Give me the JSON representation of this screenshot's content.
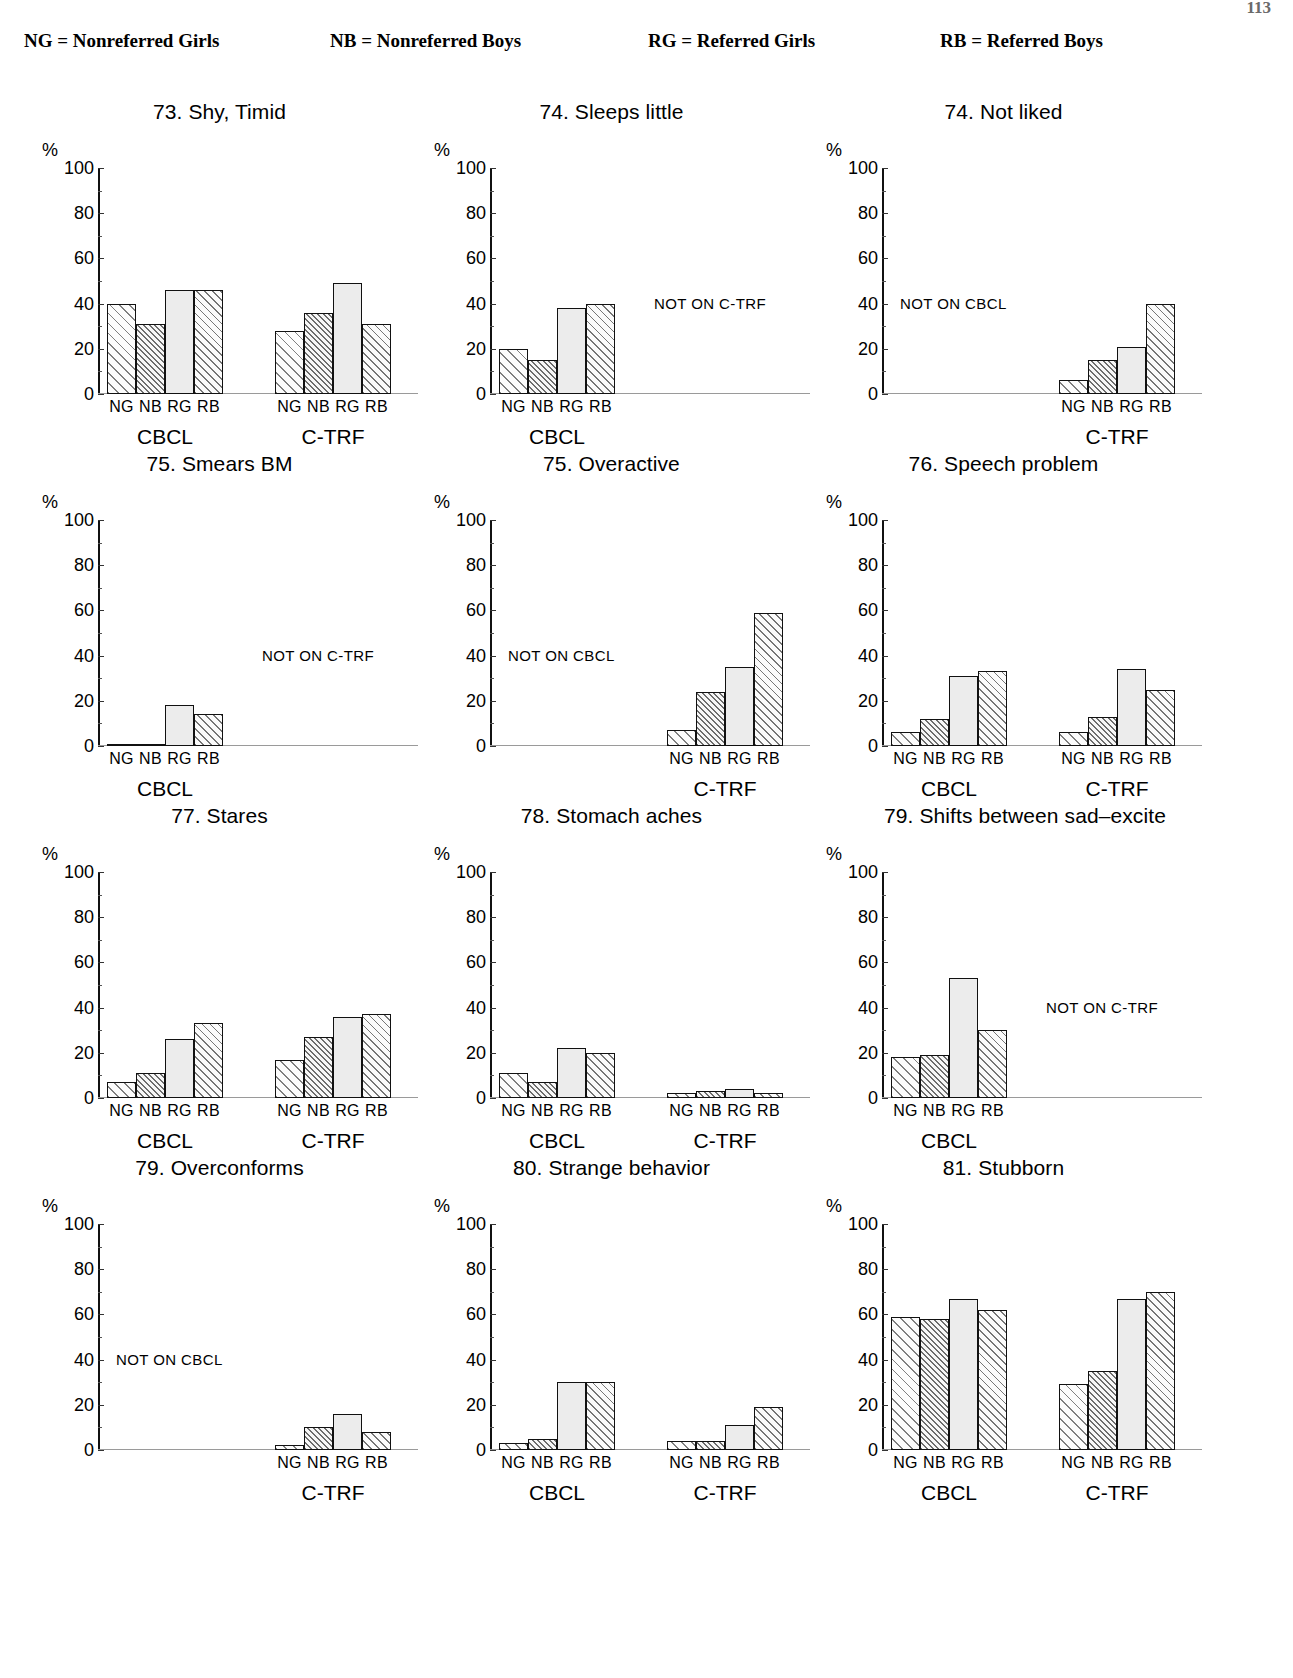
{
  "page_number": "113",
  "legend": [
    {
      "key": "NG",
      "eq": "=",
      "label": "Nonreferred Girls"
    },
    {
      "key": "NB",
      "eq": "=",
      "label": "Nonreferred Boys"
    },
    {
      "key": "RG",
      "eq": "=",
      "label": "Referred Girls"
    },
    {
      "key": "RB",
      "eq": "=",
      "label": "Referred Boys"
    }
  ],
  "axis": {
    "unit": "%",
    "ticks": [
      "100",
      "80",
      "60",
      "40",
      "20",
      "0"
    ],
    "ymin": 0,
    "ymax": 100
  },
  "group_labels": [
    "NG",
    "NB",
    "RG",
    "RB"
  ],
  "instrument_labels": {
    "cbcl": "CBCL",
    "ctrf": "C-TRF"
  },
  "notes": {
    "not_on_ctrf": "NOT ON C-TRF",
    "not_on_cbcl": "NOT ON CBCL"
  },
  "chart_data": [
    {
      "id": "item-73-shy-timid",
      "type": "bar",
      "title": "73. Shy, Timid",
      "ylabel": "%",
      "xlabel": "",
      "ylim": [
        0,
        100
      ],
      "categories": [
        "NG",
        "NB",
        "RG",
        "RB"
      ],
      "panels": [
        {
          "instrument": "CBCL",
          "values": [
            40,
            31,
            46,
            46
          ]
        },
        {
          "instrument": "C-TRF",
          "values": [
            28,
            36,
            49,
            31
          ]
        }
      ],
      "note": ""
    },
    {
      "id": "item-74-sleeps-little",
      "type": "bar",
      "title": "74. Sleeps little",
      "ylabel": "%",
      "xlabel": "",
      "ylim": [
        0,
        100
      ],
      "categories": [
        "NG",
        "NB",
        "RG",
        "RB"
      ],
      "panels": [
        {
          "instrument": "CBCL",
          "values": [
            20,
            15,
            38,
            40
          ]
        }
      ],
      "note": "NOT ON C-TRF"
    },
    {
      "id": "item-74-not-liked",
      "type": "bar",
      "title": "74. Not liked",
      "ylabel": "%",
      "xlabel": "",
      "ylim": [
        0,
        100
      ],
      "categories": [
        "NG",
        "NB",
        "RG",
        "RB"
      ],
      "panels": [
        {
          "instrument": "C-TRF",
          "values": [
            6,
            15,
            21,
            40
          ]
        }
      ],
      "note": "NOT ON CBCL"
    },
    {
      "id": "item-75-smears-bm",
      "type": "bar",
      "title": "75. Smears BM",
      "ylabel": "%",
      "xlabel": "",
      "ylim": [
        0,
        100
      ],
      "categories": [
        "NG",
        "NB",
        "RG",
        "RB"
      ],
      "panels": [
        {
          "instrument": "CBCL",
          "values": [
            1,
            1,
            18,
            14
          ]
        }
      ],
      "note": "NOT ON C-TRF"
    },
    {
      "id": "item-75-overactive",
      "type": "bar",
      "title": "75. Overactive",
      "ylabel": "%",
      "xlabel": "",
      "ylim": [
        0,
        100
      ],
      "categories": [
        "NG",
        "NB",
        "RG",
        "RB"
      ],
      "panels": [
        {
          "instrument": "C-TRF",
          "values": [
            7,
            24,
            35,
            59
          ]
        }
      ],
      "note": "NOT ON CBCL"
    },
    {
      "id": "item-76-speech-problem",
      "type": "bar",
      "title": "76. Speech problem",
      "ylabel": "%",
      "xlabel": "",
      "ylim": [
        0,
        100
      ],
      "categories": [
        "NG",
        "NB",
        "RG",
        "RB"
      ],
      "panels": [
        {
          "instrument": "CBCL",
          "values": [
            6,
            12,
            31,
            33
          ]
        },
        {
          "instrument": "C-TRF",
          "values": [
            6,
            13,
            34,
            25
          ]
        }
      ],
      "note": ""
    },
    {
      "id": "item-77-stares",
      "type": "bar",
      "title": "77. Stares",
      "ylabel": "%",
      "xlabel": "",
      "ylim": [
        0,
        100
      ],
      "categories": [
        "NG",
        "NB",
        "RG",
        "RB"
      ],
      "panels": [
        {
          "instrument": "CBCL",
          "values": [
            7,
            11,
            26,
            33
          ]
        },
        {
          "instrument": "C-TRF",
          "values": [
            17,
            27,
            36,
            37
          ]
        }
      ],
      "note": ""
    },
    {
      "id": "item-78-stomach-aches",
      "type": "bar",
      "title": "78. Stomach aches",
      "ylabel": "%",
      "xlabel": "",
      "ylim": [
        0,
        100
      ],
      "categories": [
        "NG",
        "NB",
        "RG",
        "RB"
      ],
      "panels": [
        {
          "instrument": "CBCL",
          "values": [
            11,
            7,
            22,
            20
          ]
        },
        {
          "instrument": "C-TRF",
          "values": [
            2,
            3,
            4,
            2
          ]
        }
      ],
      "note": ""
    },
    {
      "id": "item-79-shifts-between-sad-excite",
      "type": "bar",
      "title": "79. Shifts between sad–excite",
      "ylabel": "%",
      "xlabel": "",
      "ylim": [
        0,
        100
      ],
      "categories": [
        "NG",
        "NB",
        "RG",
        "RB"
      ],
      "panels": [
        {
          "instrument": "CBCL",
          "values": [
            18,
            19,
            53,
            30
          ]
        }
      ],
      "note": "NOT ON C-TRF"
    },
    {
      "id": "item-79-overconforms",
      "type": "bar",
      "title": "79. Overconforms",
      "ylabel": "%",
      "xlabel": "",
      "ylim": [
        0,
        100
      ],
      "categories": [
        "NG",
        "NB",
        "RG",
        "RB"
      ],
      "panels": [
        {
          "instrument": "C-TRF",
          "values": [
            2,
            10,
            16,
            8
          ]
        }
      ],
      "note": "NOT ON CBCL"
    },
    {
      "id": "item-80-strange-behavior",
      "type": "bar",
      "title": "80. Strange behavior",
      "ylabel": "%",
      "xlabel": "",
      "ylim": [
        0,
        100
      ],
      "categories": [
        "NG",
        "NB",
        "RG",
        "RB"
      ],
      "panels": [
        {
          "instrument": "CBCL",
          "values": [
            3,
            5,
            30,
            30
          ]
        },
        {
          "instrument": "C-TRF",
          "values": [
            4,
            4,
            11,
            19
          ]
        }
      ],
      "note": ""
    },
    {
      "id": "item-81-stubborn",
      "type": "bar",
      "title": "81. Stubborn",
      "ylabel": "%",
      "xlabel": "",
      "ylim": [
        0,
        100
      ],
      "categories": [
        "NG",
        "NB",
        "RG",
        "RB"
      ],
      "panels": [
        {
          "instrument": "CBCL",
          "values": [
            59,
            58,
            67,
            62
          ]
        },
        {
          "instrument": "C-TRF",
          "values": [
            29,
            35,
            67,
            70
          ]
        }
      ],
      "note": ""
    }
  ]
}
